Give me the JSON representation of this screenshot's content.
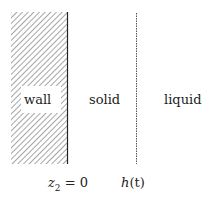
{
  "diagram": {
    "regions": {
      "wall": {
        "label": "wall",
        "fill": "hatched",
        "hatch_color": "#9a9a9a"
      },
      "solid": {
        "label": "solid"
      },
      "liquid": {
        "label": "liquid"
      }
    },
    "boundaries": {
      "wall_interface": {
        "style": "solid",
        "color": "#222222",
        "label": "z₂ = 0",
        "label_var": "z",
        "label_sub": "2",
        "label_rest": " = 0"
      },
      "phase_front": {
        "style": "dashed",
        "color": "#555555",
        "label": "h(t)",
        "label_var": "h",
        "label_rest": "(t)"
      }
    }
  }
}
